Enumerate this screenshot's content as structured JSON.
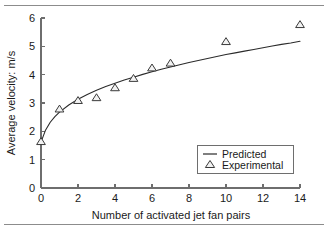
{
  "chart_data": {
    "type": "line",
    "title": "",
    "xlabel": "Number of activated jet fan pairs",
    "ylabel": "Average velocity: m/s",
    "xlim": [
      0,
      14
    ],
    "ylim": [
      0,
      6
    ],
    "xticks": [
      0,
      2,
      4,
      6,
      8,
      10,
      12,
      14
    ],
    "xticklabels": [
      "0",
      "2",
      "4",
      "6",
      "8",
      "10",
      "12",
      "14"
    ],
    "yticks": [
      0,
      1,
      2,
      3,
      4,
      5,
      6
    ],
    "yticklabels": [
      "0",
      "1",
      "2",
      "3",
      "4",
      "5",
      "6"
    ],
    "grid": false,
    "legend_position": "lower-right-inside",
    "series": [
      {
        "name": "Predicted",
        "style": "line",
        "color": "#2b2b2b",
        "x": [
          0,
          0.25,
          0.5,
          0.75,
          1,
          1.5,
          2,
          2.5,
          3,
          3.5,
          4,
          4.5,
          5,
          5.5,
          6,
          6.5,
          7,
          7.5,
          8,
          8.5,
          9,
          9.5,
          10,
          10.5,
          11,
          11.5,
          12,
          12.5,
          13,
          13.5,
          14
        ],
        "y": [
          1.62,
          2.05,
          2.32,
          2.52,
          2.68,
          2.93,
          3.13,
          3.3,
          3.45,
          3.58,
          3.7,
          3.81,
          3.91,
          4.01,
          4.1,
          4.19,
          4.27,
          4.35,
          4.43,
          4.5,
          4.57,
          4.64,
          4.71,
          4.77,
          4.83,
          4.89,
          4.95,
          5.01,
          5.07,
          5.12,
          5.18
        ]
      },
      {
        "name": "Experimental",
        "style": "marker",
        "marker": "triangle-up-open",
        "color": "#3a3a3a",
        "x": [
          0,
          1,
          2,
          3,
          4,
          5,
          6,
          7,
          10,
          14
        ],
        "y": [
          1.65,
          2.8,
          3.1,
          3.2,
          3.55,
          3.88,
          4.25,
          4.42,
          5.18,
          5.78
        ]
      }
    ],
    "legend_entries": [
      {
        "label": "Predicted",
        "marker": "line"
      },
      {
        "label": "Experimental",
        "marker": "triangle-up-open"
      }
    ]
  },
  "figure": {
    "top_rule": "",
    "bottom_rule": ""
  }
}
